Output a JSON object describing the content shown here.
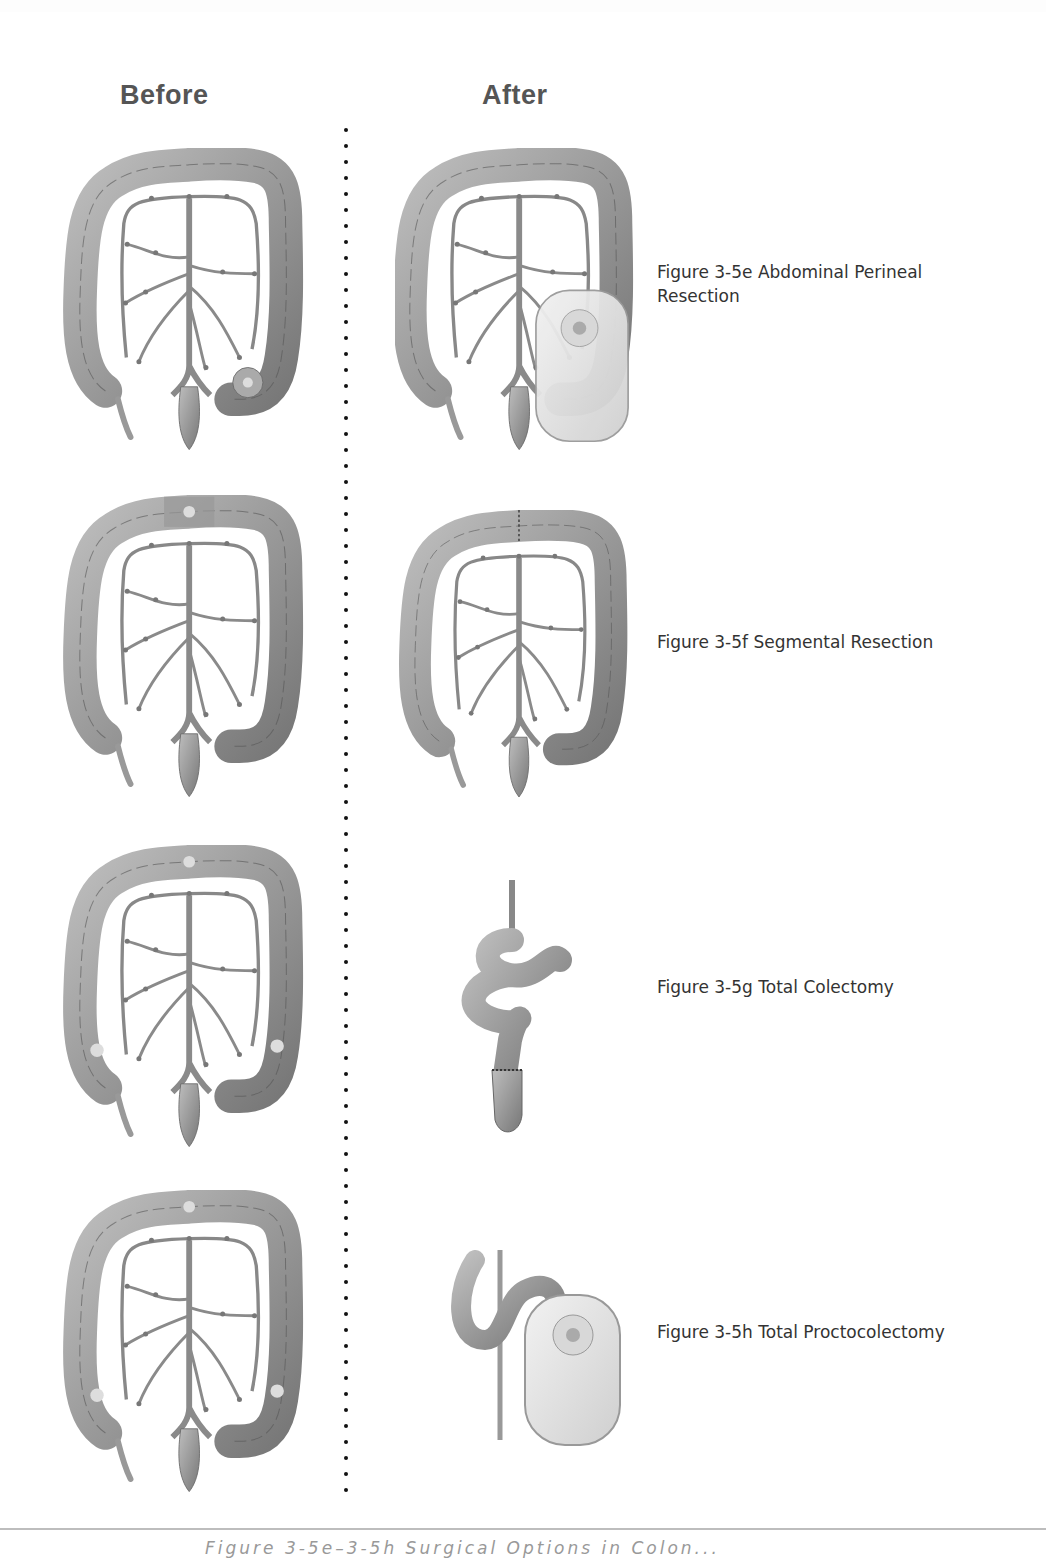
{
  "columns": {
    "before_label": "Before",
    "after_label": "After"
  },
  "rows": [
    {
      "id": "3-5e",
      "caption_line1": "Figure 3-5e Abdominal Perineal",
      "caption_line2": "Resection",
      "before_image": "colon-with-sigmoid-tumor-illustration",
      "after_image": "colon-with-colostomy-bag-illustration"
    },
    {
      "id": "3-5f",
      "caption_line1": "Figure 3-5f Segmental Resection",
      "caption_line2": "",
      "before_image": "colon-with-transverse-segment-marked-illustration",
      "after_image": "colon-with-anastomosis-illustration"
    },
    {
      "id": "3-5g",
      "caption_line1": "Figure 3-5g Total Colectomy",
      "caption_line2": "",
      "before_image": "colon-with-multiple-tumors-illustration",
      "after_image": "small-intestine-ileorectal-anastomosis-illustration"
    },
    {
      "id": "3-5h",
      "caption_line1": "Figure 3-5h Total Proctocolectomy",
      "caption_line2": "",
      "before_image": "colon-with-multiple-tumors-illustration",
      "after_image": "ileum-with-ileostomy-bag-illustration"
    }
  ],
  "footer": {
    "caption": "Figure 3-5e–3-5h  Surgical Options in Colon..."
  },
  "colors": {
    "heading": "#555555",
    "caption": "#333333",
    "tissue_light": "#c9c9c9",
    "tissue_dark": "#6e6e6e",
    "divider_dot": "#111111",
    "rule": "#bdbdbd"
  }
}
